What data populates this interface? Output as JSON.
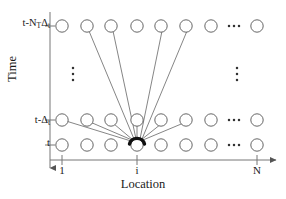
{
  "figure": {
    "kind": "lattice-diagram",
    "axes": {
      "y": {
        "name": "Time",
        "direction": "downward-arrow",
        "tick_labels": [
          "t-N_TΔ_t",
          "t-Δ_t",
          "t"
        ],
        "rows": [
          {
            "id": "top",
            "label_main": "t-N",
            "label_sub1": "T",
            "label_main2": "Δ",
            "label_sub2": "t"
          },
          {
            "id": "middle",
            "label_main": "t-",
            "label_sub1": "",
            "label_main2": "Δ",
            "label_sub2": "t"
          },
          {
            "id": "bottom",
            "label_main": "t",
            "label_sub1": "",
            "label_main2": "",
            "label_sub2": ""
          }
        ]
      },
      "x": {
        "name": "Location",
        "direction": "rightward-arrow",
        "ticks": [
          {
            "label": "1"
          },
          {
            "label": "i"
          },
          {
            "label": "N"
          }
        ]
      }
    },
    "grid": {
      "node_columns": 8,
      "node_rows": 3,
      "horizontal_ellipsis": "…",
      "vertical_ellipsis": "⋮",
      "node_shape": "circle",
      "node_fill": "#ffffff",
      "node_stroke": "#555555"
    },
    "highlight": {
      "description": "thick dark arc over center bottom node",
      "color": "#111111"
    },
    "edges": {
      "description": "lines converging from neighbouring nodes into the highlighted node",
      "color": "#666666",
      "count": 10
    },
    "colors": {
      "stroke": "#555555",
      "axis": "#777777",
      "text": "#1a1a1a",
      "highlight": "#111111"
    }
  }
}
